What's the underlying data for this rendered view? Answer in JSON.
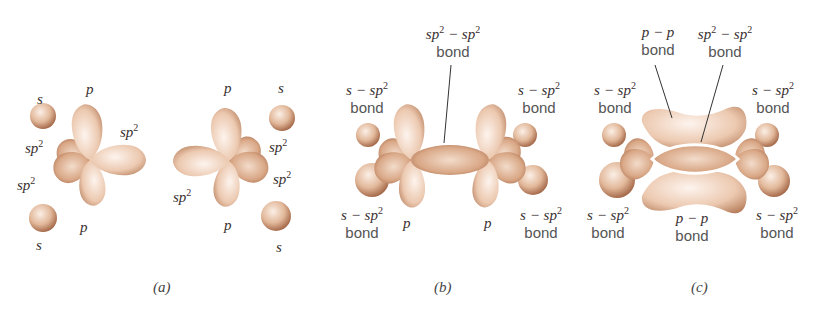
{
  "figure": {
    "panels": [
      {
        "caption": "(a)",
        "subfigures": [
          {
            "name": "carbon-left",
            "labels": {
              "s_top": "s",
              "p_top": "p",
              "sp2_right": "sp",
              "sp2_upper_left": "sp",
              "sp2_lower_left": "sp",
              "p_bottom": "p",
              "s_bottom": "s"
            }
          },
          {
            "name": "carbon-right",
            "labels": {
              "p_top": "p",
              "s_top": "s",
              "sp2_upper_right": "sp",
              "sp2_lower_right": "sp",
              "sp2_left": "sp",
              "p_bottom": "p",
              "s_bottom": "s"
            }
          }
        ]
      },
      {
        "caption": "(b)",
        "labels": {
          "center_formula": "sp",
          "center_formula_mid": " − sp",
          "center_bond": "bond",
          "top_left_formula": "s − sp",
          "top_left_bond": "bond",
          "top_right_formula": "s − sp",
          "top_right_bond": "bond",
          "bottom_left_formula": "s − sp",
          "bottom_left_bond": "bond",
          "bottom_right_formula": "s − sp",
          "bottom_right_bond": "bond",
          "p_left": "p",
          "p_right": "p"
        }
      },
      {
        "caption": "(c)",
        "labels": {
          "top_pp_formula": "p − p",
          "top_pp_bond": "bond",
          "top_sp2_formula": "sp",
          "top_sp2_formula_mid": " − sp",
          "top_sp2_bond": "bond",
          "top_left_formula": "s − sp",
          "top_left_bond": "bond",
          "top_right_formula": "s − sp",
          "top_right_bond": "bond",
          "bottom_left_formula": "s − sp",
          "bottom_left_bond": "bond",
          "bottom_right_formula": "s − sp",
          "bottom_right_bond": "bond",
          "bottom_pp_formula": "p − p",
          "bottom_pp_bond": "bond"
        }
      }
    ],
    "superscript": "2",
    "colors": {
      "orbital_light": "#f8e8dc",
      "orbital_mid": "#e0b597",
      "orbital_dark": "#a86a48",
      "text": "#3a3030",
      "leader_line": "#333333"
    }
  }
}
